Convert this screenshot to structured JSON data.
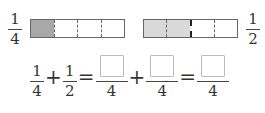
{
  "top": {
    "left_fraction": {
      "numerator": "1",
      "denominator": "4"
    },
    "right_fraction": {
      "numerator": "1",
      "denominator": "2"
    },
    "left_strip": {
      "parts": 4,
      "shaded": 1,
      "shade_color": "#a8a8a8"
    },
    "right_strip": {
      "parts": 4,
      "shaded": 2,
      "shade_color": "#d9d9d9"
    }
  },
  "equation": {
    "term1": {
      "numerator": "1",
      "denominator": "4"
    },
    "plus1": "+",
    "term2": {
      "numerator": "1",
      "denominator": "2"
    },
    "equals1": "=",
    "blank1": {
      "numerator": "",
      "denominator": "4"
    },
    "plus2": "+",
    "blank2": {
      "numerator": "",
      "denominator": "4"
    },
    "equals2": "=",
    "result": {
      "numerator": "",
      "denominator": "4"
    }
  }
}
